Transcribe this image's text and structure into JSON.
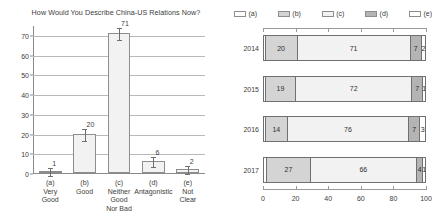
{
  "chart_data": [
    {
      "type": "bar",
      "title": "How Would You Describe China-US Relations Now?",
      "xlabel": "",
      "ylabel": "",
      "ylim": [
        0,
        75
      ],
      "yticks": [
        0,
        10,
        20,
        30,
        40,
        50,
        60,
        70
      ],
      "grid": true,
      "categories": [
        "(a)",
        "(b)",
        "(c)",
        "(d)",
        "(e)"
      ],
      "category_labels": [
        [
          "(a)",
          "Very",
          "Good"
        ],
        [
          "(b)",
          "Good"
        ],
        [
          "(c)",
          "Neither",
          "Good",
          "Nor Bad"
        ],
        [
          "(d)",
          "Antagonistic"
        ],
        [
          "(e)",
          "Not",
          "Clear"
        ]
      ],
      "values": [
        1,
        20,
        71,
        6,
        2
      ],
      "data_labels": [
        "1",
        "20",
        "71",
        "6",
        "2"
      ],
      "error_bars": true,
      "bar_fill": "#f2f2f2",
      "bar_edge": "#8d8d8d"
    },
    {
      "type": "bar",
      "orientation": "horizontal",
      "stacked": true,
      "title": "",
      "xlabel": "",
      "ylabel": "",
      "xlim": [
        0,
        100
      ],
      "xticks": [
        0,
        20,
        40,
        60,
        80,
        100
      ],
      "legend_position": "top",
      "legend": [
        "(a)",
        "(b)",
        "(c)",
        "(d)",
        "(e)"
      ],
      "legend_colors": [
        "#ffffff",
        "#d4d4d4",
        "#f2f2f2",
        "#b4b4b4",
        "#ffffff"
      ],
      "categories": [
        "2014",
        "2015",
        "2016",
        "2017"
      ],
      "series": [
        {
          "name": "(a)",
          "values": [
            1,
            1,
            1,
            2
          ]
        },
        {
          "name": "(b)",
          "values": [
            20,
            19,
            14,
            27
          ]
        },
        {
          "name": "(c)",
          "values": [
            71,
            72,
            76,
            66
          ]
        },
        {
          "name": "(d)",
          "values": [
            7,
            7,
            7,
            4
          ]
        },
        {
          "name": "(e)",
          "values": [
            2,
            1,
            3,
            1
          ]
        }
      ],
      "rows": [
        {
          "label": "2014",
          "segments": [
            {
              "series": "(a)",
              "value": 1,
              "display": ""
            },
            {
              "series": "(b)",
              "value": 20,
              "display": "20"
            },
            {
              "series": "(c)",
              "value": 71,
              "display": "71"
            },
            {
              "series": "(d)",
              "value": 7,
              "display": "7"
            },
            {
              "series": "(e)",
              "value": 2,
              "display": "2"
            }
          ]
        },
        {
          "label": "2015",
          "segments": [
            {
              "series": "(a)",
              "value": 1,
              "display": ""
            },
            {
              "series": "(b)",
              "value": 19,
              "display": "19"
            },
            {
              "series": "(c)",
              "value": 72,
              "display": "72"
            },
            {
              "series": "(d)",
              "value": 7,
              "display": "7"
            },
            {
              "series": "(e)",
              "value": 1,
              "display": "1"
            }
          ]
        },
        {
          "label": "2016",
          "segments": [
            {
              "series": "(a)",
              "value": 1,
              "display": ""
            },
            {
              "series": "(b)",
              "value": 14,
              "display": "14"
            },
            {
              "series": "(c)",
              "value": 76,
              "display": "76"
            },
            {
              "series": "(d)",
              "value": 7,
              "display": "7"
            },
            {
              "series": "(e)",
              "value": 3,
              "display": "3"
            }
          ]
        },
        {
          "label": "2017",
          "segments": [
            {
              "series": "(a)",
              "value": 2,
              "display": ""
            },
            {
              "series": "(b)",
              "value": 27,
              "display": "27"
            },
            {
              "series": "(c)",
              "value": 66,
              "display": "66"
            },
            {
              "series": "(d)",
              "value": 4,
              "display": "4"
            },
            {
              "series": "(e)",
              "value": 1,
              "display": "1"
            }
          ]
        }
      ]
    }
  ]
}
